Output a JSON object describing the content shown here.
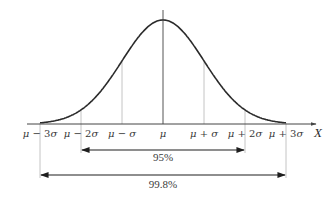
{
  "diagram": {
    "mu_px": 163,
    "sigma_px": 41,
    "baseline_y": 124,
    "peak_y": 20,
    "axis": {
      "x_start": 27,
      "x_end": 316,
      "label": "X"
    },
    "tick_labels": [
      {
        "k": -3,
        "text": "μ − 3σ"
      },
      {
        "k": -2,
        "text": "μ − 2σ"
      },
      {
        "k": -1,
        "text": "μ − σ"
      },
      {
        "k": 0,
        "text": "μ"
      },
      {
        "k": 1,
        "text": "μ + σ"
      },
      {
        "k": 2,
        "text": "μ + 2σ"
      },
      {
        "k": 3,
        "text": "μ + 3σ"
      }
    ],
    "intervals": [
      {
        "k": 2,
        "label": "95%",
        "arrow_y": 150,
        "label_y": 161,
        "guide_bottom": 153
      },
      {
        "k": 3,
        "label": "99.8%",
        "arrow_y": 175,
        "label_y": 188,
        "guide_bottom": 178
      }
    ],
    "colors": {
      "curve": "#2b2b2b",
      "axis": "#444444",
      "guides": "#b5b5b5",
      "center_line": "#555555",
      "arrow": "#1e1e1e"
    }
  }
}
